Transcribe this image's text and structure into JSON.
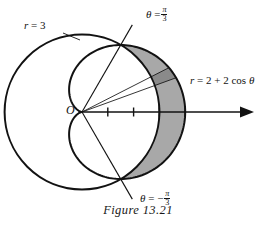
{
  "figure": {
    "caption": "Figure 13.21",
    "origin_label": "O",
    "labels": {
      "circle": {
        "lhs": "r",
        "eq": "=",
        "rhs": "3",
        "full": "r = 3"
      },
      "cardioid": {
        "lhs": "r",
        "eq": "=",
        "rhs": "2 + 2 cos",
        "theta": "θ",
        "full": "r = 2 + 2 cos θ"
      },
      "theta_upper": {
        "lhs": "θ",
        "eq": "=",
        "sign": "",
        "num": "π",
        "den": "3",
        "full": "θ = π/3"
      },
      "theta_lower": {
        "lhs": "θ",
        "eq": "=",
        "sign": "−",
        "num": "π",
        "den": "3",
        "full": "θ = −π/3"
      }
    },
    "colors": {
      "ink": "#121212",
      "crescent_fill": "#a8a8a8",
      "element_fill": "#8a8a8a",
      "background": "#ffffff"
    },
    "axis": {
      "tick_count": 4,
      "tick_values": [
        1,
        2,
        3,
        4
      ],
      "arrow": "right"
    }
  },
  "chart_data": {
    "type": "line",
    "title": "Figure 13.21",
    "coordinate_system": "polar",
    "xlabel": "",
    "ylabel": "",
    "grid": false,
    "legend": "none",
    "origin_label": "O",
    "xlim": [
      -3.6,
      5.2
    ],
    "ylim": [
      -3.4,
      3.4
    ],
    "axis_ticks": [
      1,
      2,
      3,
      4
    ],
    "series": [
      {
        "name": "r = 3",
        "equation": "r = 3",
        "type": "circle",
        "radius": 3,
        "center": [
          0,
          0
        ],
        "style": "solid-black"
      },
      {
        "name": "r = 2 + 2 cos θ",
        "equation": "r = 2 + 2 cos θ",
        "type": "cardioid",
        "a": 2,
        "b": 2,
        "max_r": 4,
        "max_r_angle_deg": 0,
        "style": "solid-black"
      }
    ],
    "rays": [
      {
        "label": "θ = π/3",
        "angle_deg": 60,
        "r_end": 3.9
      },
      {
        "label": "θ = -π/3",
        "angle_deg": -60,
        "r_end": 3.9
      }
    ],
    "element_rays": [
      {
        "angle_deg": 27.0
      },
      {
        "angle_deg": 20.0
      }
    ],
    "intersections": [
      {
        "theta_deg": 60,
        "r": 3
      },
      {
        "theta_deg": -60,
        "r": 3
      }
    ],
    "shaded_regions": [
      {
        "name": "crescent-between-curves",
        "fill": "#a8a8a8",
        "theta_range_deg": [
          -60,
          60
        ],
        "outer": "r = 2 + 2 cos θ",
        "inner": "r = 3"
      },
      {
        "name": "differential-area-element",
        "fill": "#8a8a8a",
        "theta_range_deg": [
          20,
          27
        ],
        "outer": "r = 2 + 2 cos θ",
        "inner": "r = 3"
      }
    ]
  }
}
